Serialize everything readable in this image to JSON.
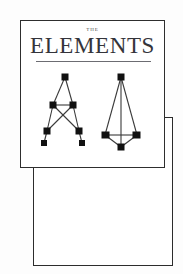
{
  "page": {
    "background_color": "#fdfdfd",
    "ink_color": "#2e2e2e"
  },
  "cover_card": {
    "border_color": "#2e2e2e",
    "background_color": "#ffffff",
    "title": {
      "eyebrow": "THE",
      "main": "ELEMENTS",
      "rule_color": "#6c6c72"
    }
  },
  "lower_panel": {
    "border_color": "#2c2c2c",
    "background_color": "#ffffff",
    "content": ""
  },
  "figures": {
    "left": {
      "name": "a-frame-truss",
      "node_color": "#111111",
      "member_color": "#3a3a3a",
      "nodes": [
        {
          "id": "apex",
          "x": 26,
          "y": 6
        },
        {
          "id": "mid-left",
          "x": 14,
          "y": 34
        },
        {
          "id": "mid-right",
          "x": 34,
          "y": 34
        },
        {
          "id": "low-left",
          "x": 8,
          "y": 60
        },
        {
          "id": "low-right",
          "x": 40,
          "y": 60
        },
        {
          "id": "foot-left",
          "x": 5,
          "y": 72
        },
        {
          "id": "foot-right",
          "x": 43,
          "y": 72
        }
      ],
      "members": [
        [
          "apex",
          "mid-left"
        ],
        [
          "apex",
          "mid-right"
        ],
        [
          "mid-left",
          "mid-right"
        ],
        [
          "mid-left",
          "low-left"
        ],
        [
          "mid-right",
          "low-right"
        ],
        [
          "mid-left",
          "low-right"
        ],
        [
          "mid-right",
          "low-left"
        ],
        [
          "low-left",
          "foot-left"
        ],
        [
          "low-right",
          "foot-right"
        ]
      ]
    },
    "right": {
      "name": "tower-truss",
      "node_color": "#111111",
      "member_color": "#3a3a3a",
      "nodes": [
        {
          "id": "apex",
          "x": 24,
          "y": 6
        },
        {
          "id": "base-left",
          "x": 8,
          "y": 64
        },
        {
          "id": "base-right",
          "x": 40,
          "y": 64
        },
        {
          "id": "bottom",
          "x": 24,
          "y": 76
        }
      ],
      "members": [
        [
          "apex",
          "base-left"
        ],
        [
          "apex",
          "base-right"
        ],
        [
          "apex",
          "bottom"
        ],
        [
          "base-left",
          "base-right"
        ],
        [
          "base-left",
          "bottom"
        ],
        [
          "base-right",
          "bottom"
        ]
      ]
    }
  }
}
